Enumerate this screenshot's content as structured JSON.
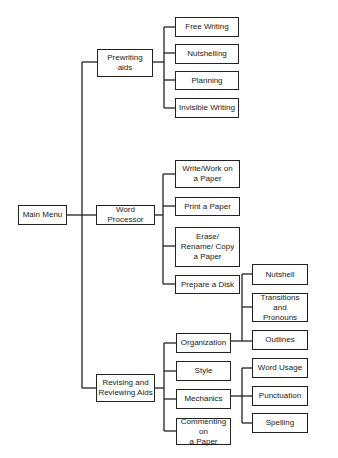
{
  "diagram": {
    "type": "hierarchy-tree",
    "root": {
      "label": "Main Menu",
      "children": [
        {
          "label": "Prewriting\naids",
          "children": [
            {
              "label": "Free Writing"
            },
            {
              "label": "Nutshelling"
            },
            {
              "label": "Planning"
            },
            {
              "label": "Invisible Writing"
            }
          ]
        },
        {
          "label": "Word Processor",
          "children": [
            {
              "label": "Write/Work on\na Paper"
            },
            {
              "label": "Print a Paper"
            },
            {
              "label": "Erase/\nRename/ Copy\na Paper"
            },
            {
              "label": "Prepare a Disk"
            }
          ]
        },
        {
          "label": "Revising and\nReviewing Aids",
          "children": [
            {
              "label": "Organization",
              "children": [
                {
                  "label": "Nutshell"
                },
                {
                  "label": "Transitions and\nPronouns"
                },
                {
                  "label": "Outlines"
                }
              ]
            },
            {
              "label": "Style"
            },
            {
              "label": "Mechanics",
              "children": [
                {
                  "label": "Word Usage"
                },
                {
                  "label": "Punctuation"
                },
                {
                  "label": "Spelling"
                }
              ]
            },
            {
              "label": "Commenting on\na Paper"
            }
          ]
        }
      ]
    }
  }
}
